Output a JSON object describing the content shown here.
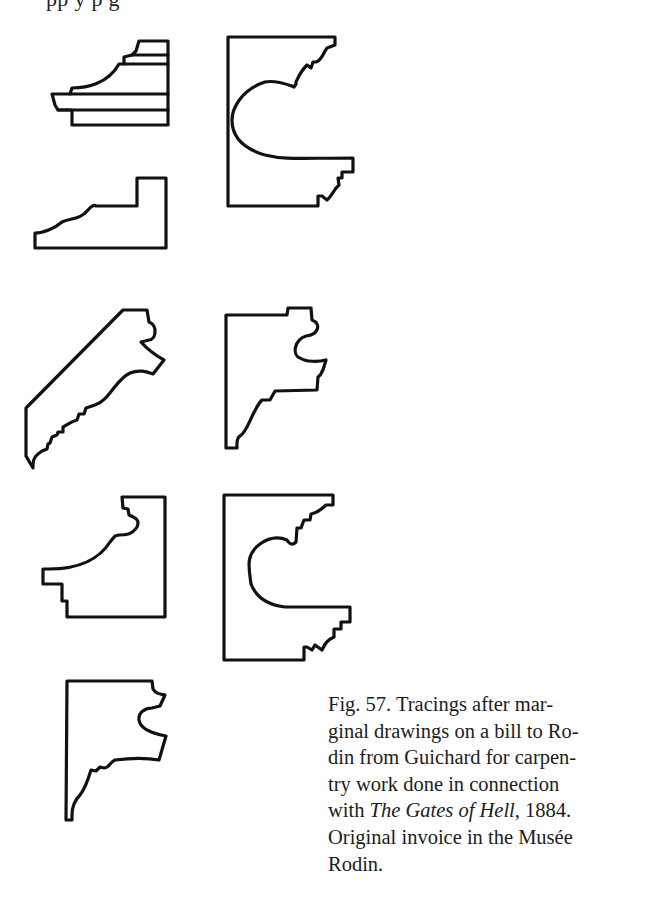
{
  "page": {
    "cut_off_text_top": "pp                                              y p                                                g"
  },
  "figure": {
    "number": "57",
    "profiles": [
      {
        "id": 1,
        "label": "stepped cornice profile with horizontal bands",
        "position": "row1-left-top"
      },
      {
        "id": 2,
        "label": "low stepped base profile",
        "position": "row1-left-bottom"
      },
      {
        "id": 3,
        "label": "tall profile with large semicircular cove",
        "position": "row1-right"
      },
      {
        "id": 4,
        "label": "diagonal bracket profile",
        "position": "row2-left"
      },
      {
        "id": 5,
        "label": "bracket profile with ovolo and steps",
        "position": "row2-right"
      },
      {
        "id": 6,
        "label": "cove profile with base step",
        "position": "row3-left"
      },
      {
        "id": 7,
        "label": "tall profile with large semicircular cove",
        "position": "row3-right"
      },
      {
        "id": 8,
        "label": "bracket profile with ovolo and steps",
        "position": "row4-left"
      }
    ]
  },
  "caption": {
    "lines": [
      {
        "text": "Fig. 57. Tracings after mar-"
      },
      {
        "text": "ginal drawings on a bill to Ro-"
      },
      {
        "text": "din from Guichard for carpen-"
      },
      {
        "text": "try work done in connection"
      },
      {
        "pre": "with ",
        "italic": "The Gates of Hell",
        "post": ", 1884."
      },
      {
        "text": "Original invoice in the Musée"
      },
      {
        "text": "Rodin."
      }
    ]
  }
}
